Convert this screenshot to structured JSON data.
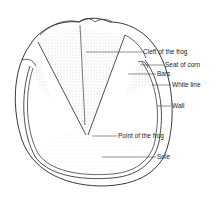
{
  "diagram": {
    "labels": [
      {
        "id": "cleft",
        "text": "Cleft of the frog",
        "x": 143,
        "y": 49
      },
      {
        "id": "seat",
        "text": "Seat of corn",
        "x": 165,
        "y": 63
      },
      {
        "id": "bars",
        "text": "Bars",
        "x": 157,
        "y": 72
      },
      {
        "id": "white",
        "text": "White line",
        "x": 172,
        "y": 82
      },
      {
        "id": "wall",
        "text": "Wall",
        "x": 172,
        "y": 104
      },
      {
        "id": "point",
        "text": "Point of the frog",
        "x": 118,
        "y": 133
      },
      {
        "id": "sole",
        "text": "Sole",
        "x": 157,
        "y": 155
      }
    ],
    "colors": {
      "line": "#222222",
      "shade": "#9a9a9a",
      "background": "#ffffff"
    }
  }
}
